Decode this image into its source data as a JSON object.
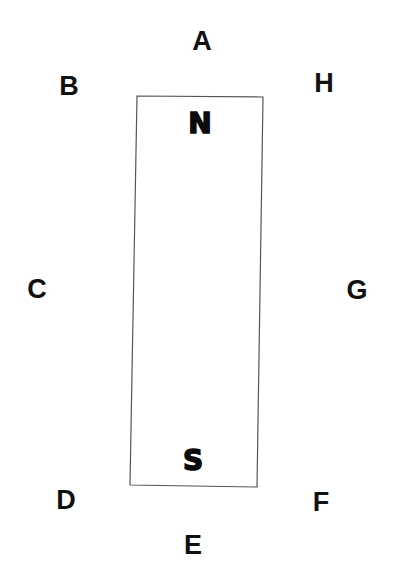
{
  "diagram": {
    "title": "",
    "magnet": {
      "north_label": "N",
      "south_label": "S",
      "stroke_color": "#555555"
    },
    "positions": [
      {
        "id": "A",
        "label": "A",
        "x": 202,
        "y": 41
      },
      {
        "id": "B",
        "label": "B",
        "x": 69,
        "y": 86
      },
      {
        "id": "C",
        "label": "C",
        "x": 37,
        "y": 289
      },
      {
        "id": "D",
        "label": "D",
        "x": 66,
        "y": 500
      },
      {
        "id": "E",
        "label": "E",
        "x": 193,
        "y": 545
      },
      {
        "id": "F",
        "label": "F",
        "x": 321,
        "y": 502
      },
      {
        "id": "G",
        "label": "G",
        "x": 357,
        "y": 290
      },
      {
        "id": "H",
        "label": "H",
        "x": 324,
        "y": 83
      }
    ]
  }
}
